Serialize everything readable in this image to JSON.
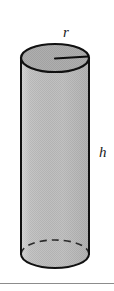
{
  "figure": {
    "type": "geometry-diagram",
    "shape_name": "cylinder",
    "background_color": "#ffffff",
    "labels": {
      "radius": "r",
      "height": "h"
    },
    "colors": {
      "outline": "#111111",
      "body_fill": "#bdbdbd",
      "top_face_fill": "#a9a9a9",
      "rule": "#8c8c8c",
      "label_text": "#1a1a1a"
    },
    "geometry": {
      "top_ellipse_center_x": 55,
      "top_ellipse_center_y": 58,
      "ellipse_radius_x": 34,
      "ellipse_radius_y": 14,
      "bottom_ellipse_center_y": 254,
      "body_height": 196,
      "radius_line_from_x": 55,
      "radius_line_from_y": 58,
      "radius_line_to_x": 89,
      "radius_line_to_y": 57
    },
    "strokes": {
      "hidden_back_arc_style": "dashed",
      "visible_front_arc_style": "solid",
      "dash_pattern": "7 5"
    }
  },
  "bottom_rule": {
    "label": "page-divider"
  }
}
